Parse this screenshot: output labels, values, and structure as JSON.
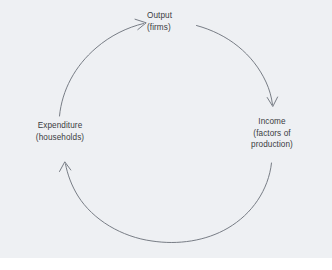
{
  "diagram": {
    "type": "circular-flow",
    "title": "",
    "flow_direction": "clockwise",
    "background_color": "#eef0f3",
    "page_color": "#ffffff",
    "line_color": "#6a6f78",
    "text_color": "#3b3c3f",
    "nodes": [
      {
        "id": "output",
        "position": "top",
        "line1": "Output",
        "line2": "(firms)"
      },
      {
        "id": "income",
        "position": "right",
        "line1": "Income",
        "line2": "(factors of",
        "line3": "production)"
      },
      {
        "id": "expenditure",
        "position": "left",
        "line1": "Expenditure",
        "line2": "(households)"
      }
    ],
    "arrows": [
      {
        "id": "output-to-income",
        "from": "output",
        "to": "income",
        "arrowhead_at": "income"
      },
      {
        "id": "income-to-expenditure",
        "from": "income",
        "to": "expenditure",
        "arrowhead_at": "expenditure"
      },
      {
        "id": "expenditure-to-output",
        "from": "expenditure",
        "to": "output",
        "arrowhead_at": "output"
      }
    ]
  }
}
